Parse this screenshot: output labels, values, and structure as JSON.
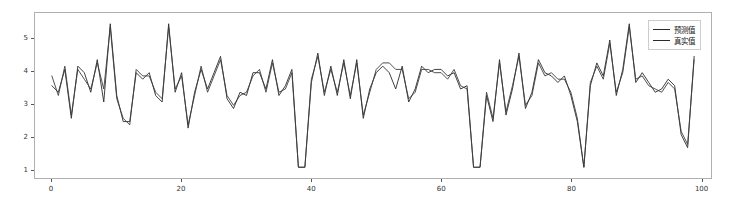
{
  "chart_data": {
    "type": "line",
    "title": "",
    "xlabel": "",
    "ylabel": "",
    "xlim": [
      -2.6,
      101.6
    ],
    "ylim": [
      0.72,
      5.78
    ],
    "xticks": [
      0,
      20,
      40,
      60,
      80,
      100
    ],
    "yticks": [
      1,
      2,
      3,
      4,
      5
    ],
    "grid": false,
    "legend_position": "upper right",
    "x": [
      0,
      1,
      2,
      3,
      4,
      5,
      6,
      7,
      8,
      9,
      10,
      11,
      12,
      13,
      14,
      15,
      16,
      17,
      18,
      19,
      20,
      21,
      22,
      23,
      24,
      25,
      26,
      27,
      28,
      29,
      30,
      31,
      32,
      33,
      34,
      35,
      36,
      37,
      38,
      39,
      40,
      41,
      42,
      43,
      44,
      45,
      46,
      47,
      48,
      49,
      50,
      51,
      52,
      53,
      54,
      55,
      56,
      57,
      58,
      59,
      60,
      61,
      62,
      63,
      64,
      65,
      66,
      67,
      68,
      69,
      70,
      71,
      72,
      73,
      74,
      75,
      76,
      77,
      78,
      79,
      80,
      81,
      82,
      83,
      84,
      85,
      86,
      87,
      88,
      89,
      90,
      91,
      92,
      93,
      94,
      95,
      96,
      97,
      98,
      99
    ],
    "series": [
      {
        "name": "预测值",
        "color": "#2b2b2b",
        "values": [
          3.55,
          3.35,
          4.05,
          2.55,
          4.15,
          3.95,
          3.35,
          4.35,
          3.05,
          5.45,
          3.25,
          2.45,
          2.45,
          3.95,
          3.75,
          3.95,
          3.25,
          3.05,
          5.45,
          3.35,
          3.95,
          2.25,
          3.35,
          4.05,
          3.45,
          3.95,
          4.45,
          3.15,
          2.85,
          3.35,
          3.25,
          3.95,
          3.95,
          3.45,
          4.35,
          3.25,
          3.55,
          4.05,
          1.05,
          1.05,
          3.65,
          4.55,
          3.25,
          4.15,
          3.25,
          4.35,
          3.15,
          4.35,
          2.55,
          3.45,
          3.95,
          4.15,
          3.95,
          3.45,
          4.15,
          3.05,
          3.45,
          4.15,
          3.95,
          4.05,
          4.05,
          3.85,
          3.95,
          3.45,
          3.55,
          1.05,
          1.05,
          3.25,
          2.45,
          4.35,
          2.65,
          3.45,
          4.55,
          2.85,
          3.35,
          4.35,
          3.95,
          3.85,
          3.65,
          3.85,
          3.25,
          2.45,
          1.05,
          3.55,
          4.25,
          3.85,
          4.95,
          3.25,
          4.05,
          5.45,
          3.65,
          3.95,
          3.65,
          3.35,
          3.45,
          3.75,
          3.55,
          2.05,
          1.65,
          4.45
        ]
      },
      {
        "name": "真实值",
        "color": "#3d3d3d",
        "values": [
          3.85,
          3.25,
          4.15,
          2.65,
          4.05,
          3.75,
          3.45,
          4.25,
          3.45,
          5.35,
          3.15,
          2.55,
          2.35,
          4.05,
          3.85,
          3.85,
          3.35,
          3.15,
          5.35,
          3.45,
          3.85,
          2.35,
          3.25,
          4.15,
          3.35,
          3.85,
          4.35,
          3.25,
          2.95,
          3.25,
          3.35,
          3.85,
          4.05,
          3.35,
          4.25,
          3.35,
          3.45,
          3.95,
          1.05,
          1.05,
          3.75,
          4.45,
          3.35,
          4.05,
          3.35,
          4.25,
          3.25,
          4.25,
          2.65,
          3.35,
          4.05,
          4.25,
          4.25,
          4.05,
          4.05,
          3.15,
          3.35,
          4.05,
          4.05,
          3.95,
          3.95,
          3.75,
          4.05,
          3.55,
          3.45,
          1.05,
          1.05,
          3.35,
          2.55,
          4.25,
          2.75,
          3.55,
          4.45,
          2.95,
          3.25,
          4.25,
          3.85,
          3.95,
          3.75,
          3.75,
          3.35,
          2.55,
          1.05,
          3.65,
          4.15,
          3.75,
          4.85,
          3.35,
          3.95,
          5.35,
          3.75,
          3.85,
          3.55,
          3.45,
          3.35,
          3.65,
          3.45,
          2.15,
          1.75,
          4.35
        ]
      }
    ]
  },
  "axes": {
    "xtick_labels": [
      "0",
      "20",
      "40",
      "60",
      "80",
      "100"
    ],
    "ytick_labels": [
      "1",
      "2",
      "3",
      "4",
      "5"
    ]
  },
  "legend": {
    "entries": [
      {
        "label": "预测值"
      },
      {
        "label": "真实值"
      }
    ]
  }
}
